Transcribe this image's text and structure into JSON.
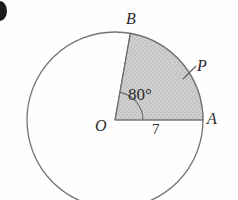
{
  "figure": {
    "type": "circle-sector-diagram",
    "background_color": "#fefefe",
    "stroke_color": "#6f6f6f",
    "sector_fill_color": "#c9c9c9",
    "sector_stroke_color": "#8a8a8a",
    "label_color": "#2a2a2a",
    "marker_color": "#1b1b1b",
    "circle": {
      "center_x": 115,
      "center_y": 120,
      "radius_px": 88
    },
    "labels": {
      "center": "O",
      "arc_endpoint_right": "A",
      "arc_endpoint_top": "B",
      "arc_point": "P",
      "angle": "80°",
      "radius_value": "7"
    },
    "geometry": {
      "central_angle_degrees": 80,
      "radius_length": 7,
      "sector_start_label": "A",
      "sector_end_label": "B",
      "point_on_arc_label": "P"
    },
    "list_marker": ")"
  }
}
